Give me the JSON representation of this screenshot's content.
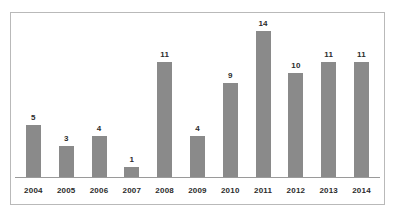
{
  "chart_data": {
    "type": "bar",
    "title": "",
    "subtitle": "",
    "xlabel": "",
    "ylabel": "",
    "categories": [
      "2004",
      "2005",
      "2006",
      "2007",
      "2008",
      "2009",
      "2010",
      "2011",
      "2012",
      "2013",
      "2014"
    ],
    "values": [
      5,
      3,
      4,
      1,
      11,
      4,
      9,
      14,
      10,
      11,
      11
    ],
    "value_labels": [
      "5",
      "3",
      "4",
      "1",
      "11",
      "4",
      "9",
      "14",
      "10",
      "11",
      "11"
    ],
    "ylim": [
      0,
      14
    ],
    "grid": false,
    "legend": null,
    "legend_position": "none",
    "annotations": [],
    "colors": {
      "bar": "#8a8a8a",
      "axis": "#9a9a9a",
      "frame": "#b9b9b9",
      "text": "#2b2b2b",
      "background": "#ffffff"
    }
  }
}
